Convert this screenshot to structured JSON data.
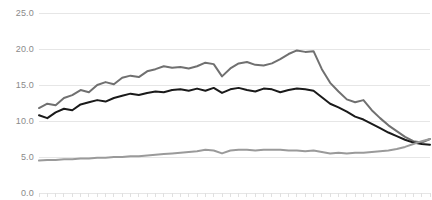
{
  "chart_data": {
    "type": "line",
    "title": "",
    "subtitle": "",
    "xlabel": "",
    "ylabel": "",
    "ylim": [
      0.0,
      25.0
    ],
    "yticks": [
      0.0,
      5.0,
      10.0,
      15.0,
      20.0,
      25.0
    ],
    "ytick_labels": [
      "0.0",
      "5.0",
      "10.0",
      "15.0",
      "20.0",
      "25.0"
    ],
    "xlim": [
      0,
      47
    ],
    "xticks": [
      0,
      1,
      2,
      3,
      4,
      5,
      6,
      7,
      8,
      9,
      10,
      11,
      12,
      13,
      14,
      15,
      16,
      17,
      18,
      19,
      20,
      21,
      22,
      23,
      24,
      25,
      26,
      27,
      28,
      29,
      30,
      31,
      32,
      33,
      34,
      35,
      36,
      37,
      38,
      39,
      40,
      41,
      42,
      43,
      44,
      45,
      46,
      47
    ],
    "xtick_labels": [],
    "grid": true,
    "grid_axis": "y",
    "grid_color": "#e6e6e6",
    "legend": false,
    "legend_position": "none",
    "background": "#ffffff",
    "x": [
      0,
      1,
      2,
      3,
      4,
      5,
      6,
      7,
      8,
      9,
      10,
      11,
      12,
      13,
      14,
      15,
      16,
      17,
      18,
      19,
      20,
      21,
      22,
      23,
      24,
      25,
      26,
      27,
      28,
      29,
      30,
      31,
      32,
      33,
      34,
      35,
      36,
      37,
      38,
      39,
      40,
      41,
      42,
      43,
      44,
      45,
      46,
      47
    ],
    "series": [
      {
        "name": "upper-series",
        "color": "#707070",
        "width": 2.0,
        "values": [
          11.8,
          12.4,
          12.2,
          13.2,
          13.6,
          14.3,
          14.0,
          15.0,
          15.4,
          15.1,
          16.0,
          16.3,
          16.1,
          16.9,
          17.2,
          17.6,
          17.4,
          17.5,
          17.3,
          17.6,
          18.1,
          17.9,
          16.2,
          17.3,
          18.0,
          18.2,
          17.8,
          17.7,
          18.0,
          18.6,
          19.3,
          19.8,
          19.6,
          19.7,
          17.2,
          15.3,
          14.1,
          13.0,
          12.6,
          12.9,
          11.5,
          10.4,
          9.4,
          8.6,
          7.8,
          7.2,
          7.0,
          7.5
        ]
      },
      {
        "name": "middle-series",
        "color": "#1a1a1a",
        "width": 2.0,
        "values": [
          10.8,
          10.4,
          11.2,
          11.7,
          11.5,
          12.3,
          12.6,
          12.9,
          12.7,
          13.2,
          13.5,
          13.8,
          13.6,
          13.9,
          14.1,
          14.0,
          14.3,
          14.4,
          14.2,
          14.5,
          14.2,
          14.6,
          13.9,
          14.4,
          14.6,
          14.3,
          14.1,
          14.5,
          14.4,
          14.0,
          14.3,
          14.5,
          14.4,
          14.2,
          13.3,
          12.4,
          11.9,
          11.3,
          10.6,
          10.2,
          9.6,
          9.0,
          8.4,
          7.9,
          7.4,
          7.0,
          6.8,
          6.7
        ]
      },
      {
        "name": "lower-series",
        "color": "#9a9a9a",
        "width": 2.0,
        "values": [
          4.5,
          4.6,
          4.6,
          4.7,
          4.7,
          4.8,
          4.8,
          4.9,
          4.9,
          5.0,
          5.0,
          5.1,
          5.1,
          5.2,
          5.3,
          5.4,
          5.5,
          5.6,
          5.7,
          5.8,
          6.0,
          5.9,
          5.5,
          5.9,
          6.0,
          6.0,
          5.9,
          6.0,
          6.0,
          6.0,
          5.9,
          5.9,
          5.8,
          5.9,
          5.7,
          5.5,
          5.6,
          5.5,
          5.6,
          5.6,
          5.7,
          5.8,
          5.9,
          6.1,
          6.4,
          6.8,
          7.2,
          7.5
        ]
      }
    ]
  }
}
